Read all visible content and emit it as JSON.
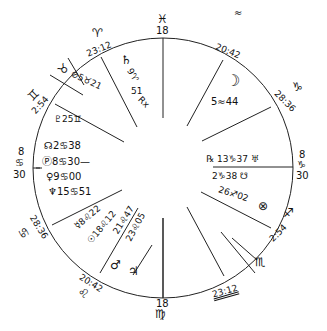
{
  "chart": {
    "type": "natal-chart-wheel",
    "ascendant": {
      "degree": "8",
      "sign_glyph": "♋",
      "minutes": "30"
    },
    "descendant": {
      "degree": "8",
      "sign_glyph": "♑",
      "minutes": "30"
    },
    "midheaven": {
      "sign_glyph": "♓",
      "degree": "18"
    },
    "imum_coeli": {
      "degree": "18",
      "sign_glyph": "♍"
    },
    "cusps": [
      {
        "house": 11,
        "sign_glyph": "♈",
        "value": "23:12"
      },
      {
        "house": 12,
        "sign_glyph": "♉",
        "value": ""
      },
      {
        "house": "12b",
        "sign_glyph": "♊",
        "value": "2:54"
      },
      {
        "house": 2,
        "sign_glyph": "♋",
        "value": "28:36"
      },
      {
        "house": 3,
        "sign_glyph": "♌",
        "value": "20:42"
      },
      {
        "house": 5,
        "sign_glyph": "♏",
        "value": "2:54"
      },
      {
        "house": 4,
        "sign_glyph": "♎",
        "value": "23:12"
      },
      {
        "house": 8,
        "sign_glyph": "♑",
        "value": "28:36"
      },
      {
        "house": 9,
        "sign_glyph": "♒",
        "value": "20:42"
      }
    ],
    "planets": [
      {
        "glyph": "♄",
        "label": "9♈51 Rx"
      },
      {
        "glyph": "⊘",
        "label": "⊘5♉21"
      },
      {
        "glyph": "♇",
        "label": "♇25♊"
      },
      {
        "glyph": "☊",
        "label": "☊2♋38"
      },
      {
        "glyph": "Ⓟ",
        "label": "Ⓟ8♋30—"
      },
      {
        "glyph": "♀",
        "label": "♀9♋00"
      },
      {
        "glyph": "♆",
        "label": "♆15♋51"
      },
      {
        "glyph": "☿",
        "label": "☿8♌22"
      },
      {
        "glyph": "☉",
        "label": "☉18♌12"
      },
      {
        "glyph": "♂",
        "label": "♂21♌47"
      },
      {
        "glyph": "♃",
        "label": "♃23♌05"
      },
      {
        "glyph": "☽",
        "label": "☽ 5♒44"
      },
      {
        "glyph": "♅",
        "label": "℞ 13♑37 ♅"
      },
      {
        "glyph": "☋",
        "label": "2♑38 ☋"
      },
      {
        "glyph": "⊗",
        "label": "26♐02 ⊗"
      }
    ]
  },
  "labels": {
    "mc_glyph": "♓",
    "mc_deg": "18",
    "ic_deg": "18",
    "ic_glyph": "♍",
    "asc_deg": "8",
    "asc_glyph": "♋",
    "asc_min": "30",
    "dsc_deg": "8",
    "dsc_glyph": "♑",
    "dsc_min": "30",
    "aries_glyph": "♈",
    "aries_cusp": "23:12",
    "taurus_glyph": "♉",
    "gemini_glyph": "♊",
    "gemini_cusp": "2:54",
    "cancer_cusp": "28:36",
    "cancer_glyph": "♋",
    "leo_cusp": "20:42",
    "leo_glyph": "♌",
    "aquarius_glyph": "≈",
    "aquarius_cusp": "20:42",
    "capricorn_glyph": "♑",
    "capricorn_cusp": "28:36",
    "sag_glyph": "♐",
    "sag_cusp": "2:54",
    "scorpio_glyph": "♏",
    "libra_cusp": "23:12",
    "libra_glyph": "♎",
    "saturn": "♄",
    "saturn_deg": "9♈",
    "saturn_min": "51",
    "saturn_rx": "Rx",
    "vertex": "⊘5♉21",
    "pluto": "♇25♊",
    "node": "☊2♋38",
    "pof": "Ⓟ8♋30—",
    "venus": "♀9♋00",
    "neptune": "♆15♋51",
    "mercury": "☿8♌22",
    "sun": "☉18♌12",
    "mars_pos": "21♌47",
    "jupiter_pos": "23♌05",
    "mars": "♂",
    "jupiter": "♃",
    "moon": "☽",
    "moon_pos": "5≈44",
    "uranus": "℞ 13♑37 ♅",
    "south_node": "2♑38 ☋",
    "fortune": "26♐02",
    "fortune_glyph": "⊗"
  }
}
